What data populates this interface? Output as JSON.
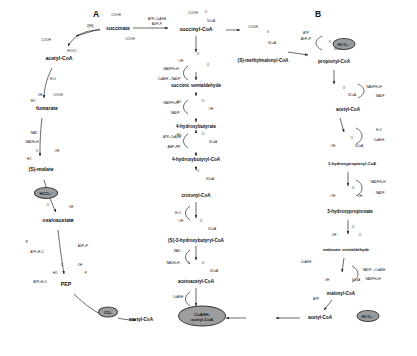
{
  "figure": {
    "panel_labels": [
      {
        "id": "A",
        "text": "A",
        "x": 96,
        "y": 14
      },
      {
        "id": "B",
        "text": "B",
        "x": 318,
        "y": 14
      }
    ],
    "metabolites": [
      {
        "id": "succinate",
        "text": "succinate",
        "x": 118,
        "y": 29
      },
      {
        "id": "succinyl-coa",
        "text": "succinyl-CoA",
        "x": 196,
        "y": 30
      },
      {
        "id": "methylmalonyl-coa",
        "text": "(S)-methylmalonyl-CoA",
        "x": 263,
        "y": 61
      },
      {
        "id": "propionyl-coa",
        "text": "propionyl-CoA",
        "x": 334,
        "y": 62
      },
      {
        "id": "acetyl-coa-right",
        "text": "acetyl-CoA",
        "x": 348,
        "y": 110
      },
      {
        "id": "3-hydroxypropionyl-coa",
        "text": "3-hydroxypropionyl-CoA",
        "x": 352,
        "y": 164
      },
      {
        "id": "3-hydroxypropionate",
        "text": "3-hydroxypropionate",
        "x": 350,
        "y": 212
      },
      {
        "id": "malonate-semialdehyde",
        "text": "malonate semialdehyde",
        "x": 346,
        "y": 250
      },
      {
        "id": "malonyl-coa",
        "text": "malonyl-CoA",
        "x": 341,
        "y": 294
      },
      {
        "id": "acetyl-coa-bottom-right",
        "text": "acetyl-CoA",
        "x": 320,
        "y": 318
      },
      {
        "id": "succinic-semialdehyde",
        "text": "succinic semialdehyde",
        "x": 196,
        "y": 86
      },
      {
        "id": "4-hydroxybutyrate",
        "text": "4-hydroxybutyrate",
        "x": 196,
        "y": 127
      },
      {
        "id": "4-hydroxybutyryl-coa",
        "text": "4-hydroxybutyryl-CoA",
        "x": 196,
        "y": 160
      },
      {
        "id": "crotonyl-coa",
        "text": "crotonyl-CoA",
        "x": 196,
        "y": 196
      },
      {
        "id": "3-hydroxybutyryl-coa",
        "text": "(S)-3-hydroxybutyryl-CoA",
        "x": 196,
        "y": 241
      },
      {
        "id": "acetoacetyl-coa",
        "text": "acetoacetyl-CoA",
        "x": 196,
        "y": 282
      },
      {
        "id": "acetyl-coa-bottom-left",
        "text": "acetyl-CoA",
        "x": 141,
        "y": 320
      },
      {
        "id": "acetyl-coa-center",
        "text": "acetyl-CoA",
        "x": 202,
        "y": 320
      },
      {
        "id": "fumarate",
        "text": "fumarate",
        "x": 59,
        "y": 59
      },
      {
        "id": "s-malate",
        "text": "(S)-malate",
        "x": 47,
        "y": 109
      },
      {
        "id": "oxaloacetate",
        "text": "oxaloacetate",
        "x": 41,
        "y": 170
      },
      {
        "id": "pep",
        "text": "PEP",
        "x": 58,
        "y": 221
      },
      {
        "id": "pyruvate",
        "text": "pyruvate",
        "x": 66,
        "y": 285
      }
    ],
    "cofactors": [
      {
        "id": "atp-coash-top",
        "text": "ATP+CoASH",
        "x": 157,
        "y": 20
      },
      {
        "id": "adp-pi-top",
        "text": "ADP+Pᵢ",
        "x": 157,
        "y": 25
      },
      {
        "id": "nadph-top",
        "text": "NADPH+H⁺",
        "x": 172,
        "y": 74
      },
      {
        "id": "coash-nadp",
        "text": "CoASH + NADP⁺",
        "x": 172,
        "y": 79
      },
      {
        "id": "nadph-2",
        "text": "NADPH+H⁺",
        "x": 172,
        "y": 104
      },
      {
        "id": "nadp-2",
        "text": "NADP⁺",
        "x": 172,
        "y": 112
      },
      {
        "id": "atp-coash-2",
        "text": "ATP+CoASH",
        "x": 172,
        "y": 139
      },
      {
        "id": "amp-ppi",
        "text": "AMP+PPᵢ",
        "x": 172,
        "y": 146
      },
      {
        "id": "h2o-crotonyl",
        "text": "H₂O",
        "x": 176,
        "y": 214
      },
      {
        "id": "nad-plus",
        "text": "NAD⁺",
        "x": 176,
        "y": 256
      },
      {
        "id": "nadh-h",
        "text": "NADH+H⁺",
        "x": 172,
        "y": 264
      },
      {
        "id": "coash-bottom",
        "text": "CoASH",
        "x": 176,
        "y": 297
      },
      {
        "id": "2h-fumarate",
        "text": "2[H]",
        "x": 90,
        "y": 27
      },
      {
        "id": "h2o-malate",
        "text": "H₂O",
        "x": 53,
        "y": 80
      },
      {
        "id": "nad-malate",
        "text": "NAD⁺",
        "x": 35,
        "y": 134
      },
      {
        "id": "nadh-malate",
        "text": "NADH+H⁺",
        "x": 33,
        "y": 143
      },
      {
        "id": "atp-pep",
        "text": "ATP+H₂O",
        "x": 37,
        "y": 253
      },
      {
        "id": "adp-pi-pep",
        "text": "ADP+Pᵢ",
        "x": 83,
        "y": 247
      },
      {
        "id": "pi-pep",
        "text": "Pᵢ",
        "x": 27,
        "y": 243
      },
      {
        "id": "pi-pyr",
        "text": "Pᵢ",
        "x": 86,
        "y": 274
      },
      {
        "id": "atp-pyr",
        "text": "ATP+H₂O",
        "x": 40,
        "y": 283
      },
      {
        "id": "adp-coash-b",
        "text": "ADP+Pᵢ",
        "x": 306,
        "y": 40
      },
      {
        "id": "atp-coash-b",
        "text": "ATP",
        "x": 306,
        "y": 34
      },
      {
        "id": "nadph-b1",
        "text": "NADPH+H⁺",
        "x": 373,
        "y": 88
      },
      {
        "id": "nadp-b1",
        "text": "NADP⁺",
        "x": 381,
        "y": 95
      },
      {
        "id": "h2o-b",
        "text": "H₂O",
        "x": 379,
        "y": 131
      },
      {
        "id": "coash-b",
        "text": "CoASH",
        "x": 379,
        "y": 141
      },
      {
        "id": "nadph-b2",
        "text": "NADPH+H⁺",
        "x": 379,
        "y": 185
      },
      {
        "id": "nadp-b2",
        "text": "NADP⁺",
        "x": 379,
        "y": 193
      },
      {
        "id": "nadp-coash-b3",
        "text": "NADP⁺+CoASH",
        "x": 374,
        "y": 271
      },
      {
        "id": "nadph-b3",
        "text": "NADPH+H⁺",
        "x": 374,
        "y": 280
      },
      {
        "id": "coash-left-b",
        "text": "CoASH",
        "x": 309,
        "y": 263
      },
      {
        "id": "atp-bottom-b",
        "text": "ATP",
        "x": 316,
        "y": 298
      },
      {
        "id": "coash-center-bottom",
        "text": "CoASH,",
        "x": 202,
        "y": 312
      },
      {
        "id": "acetyl-coa-center-label",
        "text": "acetyl-CoA",
        "x": 202,
        "y": 320
      },
      {
        "id": "coash-nadh-bottom",
        "text": "CoASH",
        "x": 176,
        "y": 305
      },
      {
        "id": "2h-left",
        "text": "2[H]",
        "x": 90,
        "y": 23
      }
    ],
    "highlight_nodes": [
      {
        "id": "hco3-left",
        "text": "HCO₃⁻",
        "x": 46,
        "y": 193,
        "w": 22,
        "h": 10
      },
      {
        "id": "co2-bottom",
        "text": "CO₂",
        "x": 108,
        "y": 312,
        "w": 18,
        "h": 9
      },
      {
        "id": "hco3-top-right",
        "text": "HCO₃⁻",
        "x": 344,
        "y": 44,
        "w": 21,
        "h": 10
      },
      {
        "id": "hco3-bottom-right",
        "text": "HCO₃⁻",
        "x": 368,
        "y": 316,
        "w": 21,
        "h": 10
      },
      {
        "id": "coash-acetyl-center",
        "text": "CoASH,\nacetyl-CoA",
        "x": 202,
        "y": 316,
        "w": 44,
        "h": 18
      }
    ],
    "structure_labels": [
      {
        "id": "cooh-succinate-1",
        "text": "COOH",
        "x": 116,
        "y": 16
      },
      {
        "id": "cooh-succinate-2",
        "text": "COOH",
        "x": 130,
        "y": 40
      },
      {
        "id": "cooh-succinyl",
        "text": "COOH",
        "x": 193,
        "y": 14
      },
      {
        "id": "scoa-succinyl",
        "text": "SCoA",
        "x": 211,
        "y": 22
      },
      {
        "id": "o-succinyl",
        "text": "O",
        "x": 206,
        "y": 13
      },
      {
        "id": "cooh-mm",
        "text": "COOH",
        "x": 253,
        "y": 28
      },
      {
        "id": "scoa-mm",
        "text": "SCoA",
        "x": 272,
        "y": 44
      },
      {
        "id": "o-mm",
        "text": "O",
        "x": 268,
        "y": 33
      },
      {
        "id": "scoa-prop",
        "text": "SCoA",
        "x": 338,
        "y": 50
      },
      {
        "id": "o-prop",
        "text": "O",
        "x": 330,
        "y": 43
      },
      {
        "id": "scoa-acr",
        "text": "SCoA",
        "x": 352,
        "y": 96
      },
      {
        "id": "o-acr",
        "text": "O",
        "x": 344,
        "y": 89
      },
      {
        "id": "oh-3hpcoa",
        "text": "OH",
        "x": 333,
        "y": 147
      },
      {
        "id": "scoa-3hpcoa",
        "text": "SCoA",
        "x": 359,
        "y": 147
      },
      {
        "id": "o-3hpcoa",
        "text": "O",
        "x": 352,
        "y": 139
      },
      {
        "id": "oh-3hp",
        "text": "OH",
        "x": 333,
        "y": 197
      },
      {
        "id": "oh2-3hp",
        "text": "OH",
        "x": 360,
        "y": 197
      },
      {
        "id": "o-3hp",
        "text": "O",
        "x": 353,
        "y": 189
      },
      {
        "id": "oh-ms",
        "text": "OH",
        "x": 334,
        "y": 236
      },
      {
        "id": "o-ms1",
        "text": "O",
        "x": 353,
        "y": 228
      },
      {
        "id": "o-ms2",
        "text": "O",
        "x": 360,
        "y": 236
      },
      {
        "id": "oh-mal",
        "text": "OH",
        "x": 327,
        "y": 281
      },
      {
        "id": "scoa-mal",
        "text": "SCoA",
        "x": 356,
        "y": 281
      },
      {
        "id": "cooh-fum1",
        "text": "COOH",
        "x": 46,
        "y": 41
      },
      {
        "id": "cooh-fum2",
        "text": "HOOC",
        "x": 72,
        "y": 52
      },
      {
        "id": "oh-mal-left",
        "text": "OH",
        "x": 40,
        "y": 96
      },
      {
        "id": "cooh-mal-left",
        "text": "COOH",
        "x": 58,
        "y": 96
      },
      {
        "id": "ho-mal-left",
        "text": "HO",
        "x": 33,
        "y": 102
      },
      {
        "id": "o-oaa",
        "text": "O",
        "x": 37,
        "y": 152
      },
      {
        "id": "oh-oaa",
        "text": "OH",
        "x": 57,
        "y": 152
      },
      {
        "id": "ho-oaa",
        "text": "HO",
        "x": 29,
        "y": 160
      },
      {
        "id": "o-pep",
        "text": "O",
        "x": 48,
        "y": 206
      },
      {
        "id": "oh-pep",
        "text": "OH",
        "x": 71,
        "y": 208
      },
      {
        "id": "p-pep",
        "text": "P",
        "x": 72,
        "y": 222
      },
      {
        "id": "o-pyr",
        "text": "O",
        "x": 62,
        "y": 266
      },
      {
        "id": "oh-pyr",
        "text": "OH",
        "x": 80,
        "y": 266
      },
      {
        "id": "ho-pyr",
        "text": "HO",
        "x": 55,
        "y": 274
      },
      {
        "id": "oh-ss",
        "text": "OH",
        "x": 181,
        "y": 62
      },
      {
        "id": "o-ss1",
        "text": "O",
        "x": 198,
        "y": 55
      },
      {
        "id": "o-ss2",
        "text": "O",
        "x": 208,
        "y": 66
      },
      {
        "id": "ho-4hb",
        "text": "HO",
        "x": 179,
        "y": 103
      },
      {
        "id": "o-4hb",
        "text": "O",
        "x": 203,
        "y": 102
      },
      {
        "id": "oh-4hb",
        "text": "OH",
        "x": 211,
        "y": 110
      },
      {
        "id": "ho-4hbcoa",
        "text": "HO",
        "x": 179,
        "y": 136
      },
      {
        "id": "o-4hbcoa",
        "text": "O",
        "x": 203,
        "y": 135
      },
      {
        "id": "scoa-4hbcoa",
        "text": "SCoA",
        "x": 213,
        "y": 143
      },
      {
        "id": "o-crot",
        "text": "O",
        "x": 198,
        "y": 172
      },
      {
        "id": "scoa-crot",
        "text": "SCoA",
        "x": 210,
        "y": 180
      },
      {
        "id": "oh-3hbcoa",
        "text": "OH",
        "x": 181,
        "y": 222
      },
      {
        "id": "o-3hbcoa",
        "text": "O",
        "x": 201,
        "y": 222
      },
      {
        "id": "scoa-3hbcoa",
        "text": "SCoA",
        "x": 212,
        "y": 230
      },
      {
        "id": "o-aacoa1",
        "text": "O",
        "x": 189,
        "y": 264
      },
      {
        "id": "o-aacoa2",
        "text": "O",
        "x": 203,
        "y": 264
      },
      {
        "id": "scoa-aacoa",
        "text": "SCoA",
        "x": 214,
        "y": 272
      }
    ],
    "colors": {
      "node_fill": "#9d9d9d",
      "node_stroke": "#3a3a3a",
      "line": "#2a2a2a",
      "text": "#111111",
      "background": "#ffffff"
    }
  }
}
